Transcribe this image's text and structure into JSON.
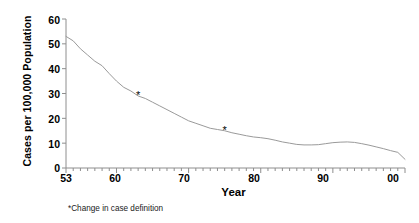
{
  "chart_data": {
    "type": "line",
    "title": "",
    "xlabel": "Year",
    "ylabel": "Cases per 100,000 Population",
    "xlim": [
      1953,
      2000
    ],
    "ylim": [
      0,
      60
    ],
    "grid": false,
    "legend": null,
    "y_ticks": [
      60,
      50,
      40,
      30,
      20,
      10,
      0
    ],
    "y_tick_labels": [
      "60",
      "50",
      "40",
      "30",
      "20",
      "10",
      "0"
    ],
    "x_ticks": [
      1953,
      1960,
      1970,
      1980,
      1990,
      2000
    ],
    "x_tick_labels": [
      "53",
      "60",
      "70",
      "80",
      "90",
      "00"
    ],
    "x_minor_tick_interval": 1,
    "series": [
      {
        "name": "Cases per 100,000 Population",
        "color": "#9a9a9a",
        "x": [
          1953,
          1954,
          1955,
          1956,
          1957,
          1958,
          1959,
          1960,
          1961,
          1962,
          1963,
          1964,
          1965,
          1966,
          1967,
          1968,
          1969,
          1970,
          1971,
          1972,
          1973,
          1974,
          1975,
          1976,
          1977,
          1978,
          1979,
          1980,
          1981,
          1982,
          1983,
          1984,
          1985,
          1986,
          1987,
          1988,
          1989,
          1990,
          1991,
          1992,
          1993,
          1994,
          1995,
          1996,
          1997,
          1998,
          1999,
          2000
        ],
        "values": [
          53.0,
          51.2,
          48.0,
          45.5,
          43.0,
          41.2,
          38.0,
          35.0,
          32.5,
          31.0,
          29.0,
          28.0,
          26.5,
          25.0,
          23.5,
          22.0,
          20.5,
          19.0,
          18.0,
          17.0,
          16.0,
          15.5,
          15.0,
          14.2,
          13.6,
          13.0,
          12.5,
          12.2,
          11.8,
          11.2,
          10.5,
          10.0,
          9.5,
          9.3,
          9.3,
          9.4,
          9.8,
          10.2,
          10.4,
          10.5,
          10.3,
          9.8,
          9.2,
          8.5,
          7.8,
          7.0,
          6.3,
          3.5
        ]
      }
    ],
    "annotations": [
      {
        "type": "marker",
        "symbol": "*",
        "x": 1963,
        "y": 29.0,
        "note": "Change in case definition"
      },
      {
        "type": "marker",
        "symbol": "*",
        "x": 1975,
        "y": 15.0,
        "note": "Change in case definition"
      }
    ],
    "footnote": "*Change in case definition"
  },
  "axes": {
    "y_title": "Cases per 100,000 Population",
    "x_title": "Year",
    "y_labels": [
      "60",
      "50",
      "40",
      "30",
      "20",
      "10",
      "0"
    ],
    "x_labels": [
      "53",
      "60",
      "70",
      "80",
      "90",
      "00"
    ]
  },
  "footnote": {
    "text": "*Change in case definition"
  },
  "colors": {
    "line": "#9a9a9a",
    "axis": "#808080",
    "text": "#000000"
  }
}
